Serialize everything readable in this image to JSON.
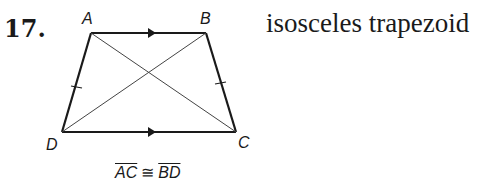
{
  "problem": {
    "number": "17.",
    "description": "isosceles trapezoid",
    "top_cut_text": "p                        p       p"
  },
  "figure": {
    "vertices": {
      "A": {
        "label": "A",
        "x": 91,
        "y": 33
      },
      "B": {
        "label": "B",
        "x": 206,
        "y": 33
      },
      "C": {
        "label": "C",
        "x": 236,
        "y": 132
      },
      "D": {
        "label": "D",
        "x": 62,
        "y": 132
      }
    },
    "parallel_marks": [
      "AB",
      "DC"
    ],
    "congruent_tick_marks": [
      "AD",
      "BC"
    ],
    "diagonals": [
      "AC",
      "BD"
    ]
  },
  "caption": {
    "seg1": "AC",
    "symbol": "≅",
    "seg2": "BD"
  }
}
